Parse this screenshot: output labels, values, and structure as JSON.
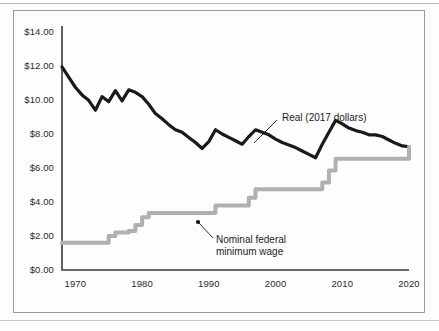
{
  "chart_data": {
    "type": "line",
    "title": "",
    "subtitle": "",
    "xlabel": "",
    "ylabel": "",
    "xlim": [
      1968,
      2020
    ],
    "ylim": [
      0,
      14
    ],
    "grid": false,
    "legend_position": "inline-annotations",
    "y_tick_labels": [
      "$14.00",
      "$12.00",
      "$10.00",
      "$8.00",
      "$6.00",
      "$4.00",
      "$2.00",
      "$0.00"
    ],
    "y_tick_values": [
      14,
      12,
      10,
      8,
      6,
      4,
      2,
      0
    ],
    "x_tick_labels": [
      "1970",
      "1980",
      "1990",
      "2000",
      "2010",
      "2020"
    ],
    "x_tick_values": [
      1970,
      1980,
      1990,
      2000,
      2010,
      2020
    ],
    "annotations": [
      {
        "name": "real-series-label",
        "text": "Real (2017 dollars)",
        "lines": [
          "Real (2017 dollars)"
        ],
        "text_x": 282,
        "text_y": 112,
        "leader_from_x": 277,
        "leader_from_y": 120,
        "leader_to_x": 254,
        "leader_to_y": 143
      },
      {
        "name": "nominal-series-label",
        "text": "Nominal federal minimum wage",
        "lines": [
          "Nominal federal",
          "minimum wage"
        ],
        "text_x": 216,
        "text_y": 234,
        "leader_from_x": 213,
        "leader_from_y": 238,
        "leader_to_x": 198,
        "leader_to_y": 222,
        "marker": true
      }
    ],
    "series": [
      {
        "name": "Real (2017 dollars)",
        "label": "Real (2017 dollars)",
        "color": "#1a1a1a",
        "style": "line",
        "width": 3.2,
        "x": [
          1968,
          1969,
          1970,
          1971,
          1972,
          1973,
          1974,
          1975,
          1976,
          1977,
          1978,
          1979,
          1980,
          1981,
          1982,
          1983,
          1984,
          1985,
          1986,
          1987,
          1988,
          1989,
          1990,
          1991,
          1992,
          1993,
          1994,
          1995,
          1996,
          1997,
          1998,
          1999,
          2000,
          2001,
          2002,
          2003,
          2004,
          2005,
          2006,
          2007,
          2008,
          2009,
          2010,
          2011,
          2012,
          2013,
          2014,
          2015,
          2016,
          2017,
          2018,
          2019,
          2020
        ],
        "values": [
          11.95,
          11.35,
          10.75,
          10.3,
          9.98,
          9.4,
          10.2,
          9.9,
          10.55,
          9.95,
          10.6,
          10.45,
          10.2,
          9.75,
          9.2,
          8.9,
          8.55,
          8.25,
          8.1,
          7.8,
          7.5,
          7.15,
          7.55,
          8.25,
          8.0,
          7.8,
          7.6,
          7.4,
          7.85,
          8.25,
          8.1,
          7.95,
          7.7,
          7.5,
          7.35,
          7.2,
          7.0,
          6.8,
          6.6,
          7.4,
          8.1,
          8.8,
          8.6,
          8.35,
          8.2,
          8.1,
          7.95,
          7.95,
          7.85,
          7.65,
          7.45,
          7.3,
          7.25
        ]
      },
      {
        "name": "Nominal federal minimum wage",
        "label": "Nominal federal minimum wage",
        "color": "#b0b0b0",
        "style": "step",
        "width": 4.0,
        "x": [
          1968,
          1974,
          1975,
          1976,
          1978,
          1979,
          1980,
          1981,
          1990,
          1991,
          1996,
          1997,
          2007,
          2008,
          2009,
          2020
        ],
        "values": [
          1.6,
          1.6,
          2.0,
          2.2,
          2.3,
          2.65,
          3.1,
          3.35,
          3.35,
          3.8,
          4.25,
          4.75,
          5.15,
          5.85,
          6.55,
          7.25
        ]
      }
    ]
  },
  "axes": {
    "y_axis_name": "dollars-per-hour",
    "x_axis_name": "year"
  }
}
